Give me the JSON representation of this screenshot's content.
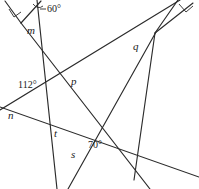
{
  "figure": {
    "stroke_color": "#2b2b2b",
    "background_color": "#ffffff",
    "angle_labels": [
      {
        "id": "angle-60",
        "text": "60°",
        "x": 47,
        "y": 9
      },
      {
        "id": "angle-112",
        "text": "112°",
        "x": 19,
        "y": 85
      },
      {
        "id": "angle-70",
        "text": "70°",
        "x": 89,
        "y": 145
      }
    ],
    "variable_labels": [
      {
        "id": "label-m",
        "text": "m",
        "x": 27,
        "y": 27
      },
      {
        "id": "label-q",
        "text": "q",
        "x": 133,
        "y": 45
      },
      {
        "id": "label-p",
        "text": "p",
        "x": 71,
        "y": 81
      },
      {
        "id": "label-n",
        "text": "n",
        "x": 9,
        "y": 114
      },
      {
        "id": "label-t",
        "text": "t",
        "x": 54,
        "y": 132
      },
      {
        "id": "label-s",
        "text": "s",
        "x": 71,
        "y": 153
      }
    ],
    "right_angle_markers": [
      {
        "id": "right-angle-left",
        "x": 15,
        "y": 14
      },
      {
        "id": "right-angle-right",
        "x": 185,
        "y": 9
      }
    ],
    "lines": [
      {
        "id": "line-m-left-leg",
        "x1": 6,
        "y1": 2,
        "x2": 21,
        "y2": 22
      },
      {
        "id": "line-m-right-leg",
        "x1": 21,
        "y1": 22,
        "x2": 44,
        "y2": 2
      },
      {
        "id": "line-steep-long",
        "x1": 37,
        "y1": 0,
        "x2": 57,
        "y2": 189
      },
      {
        "id": "line-upper-right-leg",
        "x1": 192,
        "y1": 2,
        "x2": 155,
        "y2": 33
      },
      {
        "id": "line-upper-right-leg2",
        "x1": 176,
        "y1": 0,
        "x2": 155,
        "y2": 33
      },
      {
        "id": "line-diagonal-ne-sw",
        "x1": 178,
        "y1": 0,
        "x2": 0,
        "y2": 110
      },
      {
        "id": "line-diagonal-long-right",
        "x1": 155,
        "y1": 33,
        "x2": 69,
        "y2": 189
      },
      {
        "id": "line-from-q-down",
        "x1": 155,
        "y1": 33,
        "x2": 133,
        "y2": 178
      },
      {
        "id": "line-p-to-bottomright",
        "x1": 21,
        "y1": 22,
        "x2": 148,
        "y2": 189
      },
      {
        "id": "line-n-to-right",
        "x1": 0,
        "y1": 107,
        "x2": 199,
        "y2": 176
      }
    ]
  }
}
